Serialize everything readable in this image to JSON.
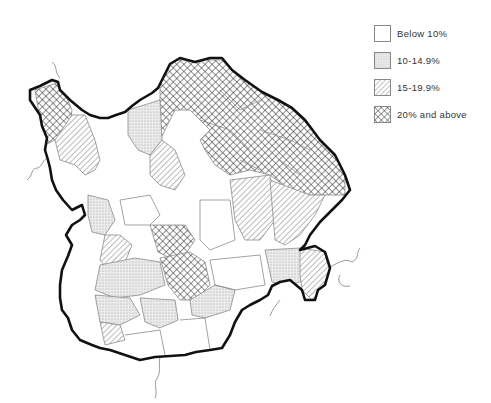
{
  "map": {
    "type": "choropleth",
    "title": "",
    "fill_styles": {
      "below_10": {
        "pattern": "none",
        "color": "#ffffff"
      },
      "10_14_9": {
        "pattern": "stipple",
        "color": "#d9d9d9"
      },
      "15_19_9": {
        "pattern": "diagonal-hatch",
        "color": "#8c8c8c"
      },
      "20_above": {
        "pattern": "crosshatch",
        "color": "#333333"
      }
    }
  },
  "legend": {
    "items": [
      {
        "label": "Below 10%",
        "class": "below_10"
      },
      {
        "label": "10-14.9%",
        "class": "10_14_9"
      },
      {
        "label": "15-19.9%",
        "class": "15_19_9"
      },
      {
        "label": "20% and above",
        "class": "20_above"
      }
    ]
  }
}
